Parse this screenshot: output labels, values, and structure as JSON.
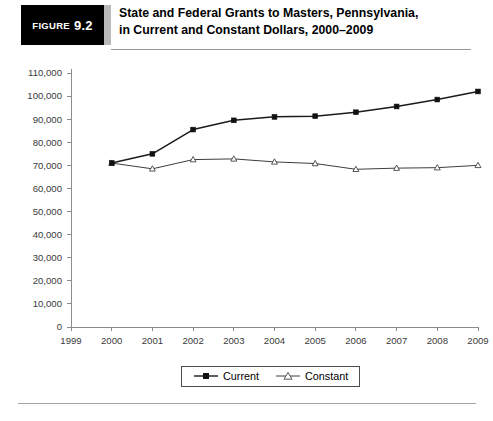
{
  "header": {
    "badge_word": "Figure",
    "badge_number": "9.2",
    "title_line1": "State and Federal Grants to Masters, Pennsylvania,",
    "title_line2": "in Current and Constant Dollars, 2000–2009",
    "badge_bg": "#000000",
    "badge_fg": "#ffffff",
    "band_color": "#b9b9b9",
    "rule_color": "#999999"
  },
  "chart_data": {
    "type": "line",
    "title": "State and Federal Grants to Masters, Pennsylvania, in Current and Constant Dollars, 2000–2009",
    "xlabel": "",
    "ylabel": "",
    "x": [
      2000,
      2001,
      2002,
      2003,
      2004,
      2005,
      2006,
      2007,
      2008,
      2009
    ],
    "x_tick_labels": [
      "1999",
      "2000",
      "2001",
      "2002",
      "2003",
      "2004",
      "2005",
      "2006",
      "2007",
      "2008",
      "2009"
    ],
    "y_tick_labels": [
      "0",
      "10,000",
      "20,000",
      "30,000",
      "40,000",
      "50,000",
      "60,000",
      "70,000",
      "80,000",
      "90,000",
      "100,000",
      "110,000"
    ],
    "y_tick_values": [
      0,
      10000,
      20000,
      30000,
      40000,
      50000,
      60000,
      70000,
      80000,
      90000,
      100000,
      110000
    ],
    "xlim": [
      1999,
      2009
    ],
    "ylim": [
      0,
      110000
    ],
    "grid": false,
    "legend_position": "bottom-center",
    "series": [
      {
        "name": "Current",
        "marker": "filled-square",
        "color": "#1b1b1b",
        "values": [
          71000,
          75000,
          85500,
          89500,
          91000,
          91300,
          93000,
          95500,
          98500,
          102000
        ]
      },
      {
        "name": "Constant",
        "marker": "hollow-triangle",
        "color": "#3d3d3d",
        "values": [
          71000,
          68500,
          72500,
          72800,
          71500,
          70800,
          68300,
          68800,
          69000,
          70000
        ]
      }
    ]
  },
  "legend": {
    "entries": [
      {
        "label": "Current"
      },
      {
        "label": "Constant"
      }
    ]
  }
}
